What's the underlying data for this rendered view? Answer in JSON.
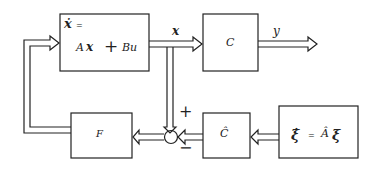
{
  "diagram": {
    "type": "block-diagram",
    "blocks": {
      "plant": {
        "line1_lhs": "ẋ",
        "line1_eq": "=",
        "line2": "Ax + Bu",
        "line2_a": "A",
        "line2_x": "x",
        "line2_plus": "+",
        "line2_bu": "Bu"
      },
      "output_matrix": {
        "label": "C"
      },
      "feedback_gain": {
        "label": "F"
      },
      "estimator_output": {
        "label": "Ĉ"
      },
      "exosystem": {
        "lhs": "ξ̇",
        "eq": "=",
        "rhs_a": "Â",
        "rhs_xi": "ξ"
      }
    },
    "signals": {
      "state": "x",
      "output": "y"
    },
    "summing_junction": {
      "plus_sign": "+",
      "minus_sign": "−"
    }
  }
}
